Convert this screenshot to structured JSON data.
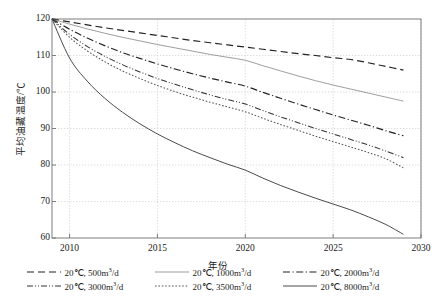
{
  "chart_data": {
    "type": "line",
    "title": "",
    "xlabel": "年份",
    "ylabel": "平均油藏温度/℃",
    "xlim": [
      2009,
      2030
    ],
    "ylim": [
      60,
      120
    ],
    "xticks": [
      2010,
      2015,
      2020,
      2025,
      2030
    ],
    "yticks": [
      60,
      70,
      80,
      90,
      100,
      110,
      120
    ],
    "grid": true,
    "legend_position": "bottom",
    "x": [
      2009,
      2010,
      2011,
      2012,
      2013,
      2014,
      2015,
      2016,
      2017,
      2018,
      2019,
      2020,
      2021,
      2022,
      2023,
      2024,
      2025,
      2026,
      2027,
      2028,
      2029
    ],
    "series": [
      {
        "name": "20℃, 500m³/d",
        "style": "dashed",
        "color": "#222222",
        "values": [
          120.0,
          119.2,
          118.4,
          117.6,
          116.9,
          116.2,
          115.5,
          114.8,
          114.1,
          113.5,
          112.9,
          112.3,
          111.7,
          111.1,
          110.5,
          110.0,
          109.4,
          108.9,
          108.0,
          107.0,
          106.0
        ]
      },
      {
        "name": "20℃, 1000m³/d",
        "style": "solid-light",
        "color": "#8c8c8c",
        "values": [
          120.0,
          118.6,
          117.3,
          116.1,
          115.0,
          114.0,
          113.0,
          112.1,
          111.2,
          110.3,
          109.5,
          108.7,
          107.2,
          105.8,
          104.4,
          103.1,
          101.9,
          100.8,
          99.7,
          98.6,
          97.5
        ]
      },
      {
        "name": "20℃, 2000m³/d",
        "style": "dash-dot",
        "color": "#222222",
        "values": [
          120.0,
          117.2,
          114.8,
          112.7,
          110.8,
          109.2,
          107.7,
          106.3,
          105.0,
          103.8,
          102.7,
          101.6,
          99.9,
          98.3,
          96.7,
          95.2,
          93.7,
          92.3,
          90.9,
          89.4,
          88.0
        ]
      },
      {
        "name": "20℃, 3000m³/d",
        "style": "dash-dot-dot",
        "color": "#333333",
        "values": [
          120.0,
          115.8,
          112.5,
          109.8,
          107.5,
          105.5,
          103.7,
          102.1,
          100.6,
          99.2,
          97.9,
          96.7,
          94.9,
          93.2,
          91.6,
          90.0,
          88.5,
          87.0,
          85.5,
          83.8,
          82.0
        ]
      },
      {
        "name": "20℃, 3500m³/d",
        "style": "dotted",
        "color": "#555555",
        "values": [
          120.0,
          115.0,
          111.3,
          108.3,
          105.8,
          103.7,
          101.8,
          100.1,
          98.6,
          97.2,
          95.9,
          94.6,
          92.8,
          91.1,
          89.5,
          87.9,
          86.4,
          84.9,
          83.4,
          81.7,
          79.2
        ]
      },
      {
        "name": "20℃, 8000m³/d",
        "style": "solid-dark",
        "color": "#4a4a4a",
        "values": [
          120.0,
          109.3,
          103.0,
          98.3,
          94.5,
          91.3,
          88.5,
          86.1,
          83.9,
          82.0,
          80.2,
          78.6,
          76.4,
          74.4,
          72.6,
          70.9,
          69.3,
          67.7,
          65.8,
          63.7,
          61.0
        ]
      }
    ]
  },
  "legend": {
    "rows": [
      [
        {
          "label_prefix": "20℃, 500m",
          "label_sup": "3",
          "label_suffix": "/d",
          "style": "dashed",
          "color": "#222222"
        },
        {
          "label_prefix": "20℃, 1000m",
          "label_sup": "3",
          "label_suffix": "/d",
          "style": "solid-light",
          "color": "#8c8c8c"
        },
        {
          "label_prefix": "20℃, 2000m",
          "label_sup": "3",
          "label_suffix": "/d",
          "style": "dash-dot",
          "color": "#222222"
        }
      ],
      [
        {
          "label_prefix": "20℃, 3000m",
          "label_sup": "3",
          "label_suffix": "/d",
          "style": "dash-dot-dot",
          "color": "#333333"
        },
        {
          "label_prefix": "20℃, 3500m",
          "label_sup": "3",
          "label_suffix": "/d",
          "style": "dotted",
          "color": "#555555"
        },
        {
          "label_prefix": "20℃, 8000m",
          "label_sup": "3",
          "label_suffix": "/d",
          "style": "solid-dark",
          "color": "#4a4a4a"
        }
      ]
    ]
  },
  "axes": {
    "y_title": "平均油藏温度/℃",
    "x_title": "年份"
  },
  "colors": {
    "grid": "#cfcfcf",
    "frame": "#6f6f6f",
    "text": "#1a1a1a"
  }
}
